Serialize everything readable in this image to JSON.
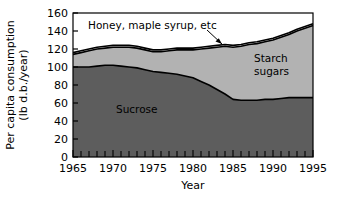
{
  "chart_data": {
    "type": "area",
    "stacked": true,
    "title": "",
    "xlabel": "Year",
    "ylabel": "Per capita consumption (lb d.b./year)",
    "ylabel_line1": "Per capita consumption",
    "ylabel_line2": "(lb d.b./year)",
    "xlim": [
      1965,
      1995
    ],
    "ylim": [
      0,
      160
    ],
    "ytick_labels": [
      "0",
      "20",
      "40",
      "60",
      "80",
      "100",
      "120",
      "140",
      "160"
    ],
    "ytick_values": [
      0,
      20,
      40,
      60,
      80,
      100,
      120,
      140,
      160
    ],
    "xtick_labels": [
      "1965",
      "1970",
      "1975",
      "1980",
      "1985",
      "1990",
      "1995"
    ],
    "xtick_values": [
      1965,
      1970,
      1975,
      1980,
      1985,
      1990,
      1995
    ],
    "x_minor_tick_step": 1,
    "grid": false,
    "legend_position": "inline-labels",
    "x": [
      1965,
      1966,
      1967,
      1968,
      1969,
      1970,
      1971,
      1972,
      1973,
      1974,
      1975,
      1976,
      1977,
      1978,
      1979,
      1980,
      1981,
      1982,
      1983,
      1984,
      1985,
      1986,
      1987,
      1988,
      1989,
      1990,
      1991,
      1992,
      1993,
      1994,
      1995
    ],
    "series": [
      {
        "name": "Sucrose",
        "label": "Sucrose",
        "color": "#5d5d5d",
        "values": [
          100,
          100,
          100,
          101,
          102,
          102,
          101,
          100,
          99,
          97,
          95,
          94,
          93,
          92,
          90,
          88,
          84,
          80,
          75,
          70,
          64,
          63,
          63,
          63,
          64,
          64,
          65,
          66,
          66,
          66,
          66
        ]
      },
      {
        "name": "Starch sugars",
        "label": "Starch sugars",
        "color": "#b2b2b2",
        "values": [
          14,
          16,
          18,
          19,
          19,
          20,
          21,
          22,
          22,
          22,
          22,
          23,
          25,
          27,
          29,
          31,
          36,
          41,
          47,
          53,
          58,
          60,
          62,
          63,
          64,
          66,
          68,
          70,
          74,
          77,
          80
        ]
      },
      {
        "name": "Honey, maple syrup, etc",
        "label": "Honey, maple syrup, etc",
        "color": "#ffffff",
        "values": [
          2,
          2,
          2,
          2,
          2,
          2,
          2,
          2,
          2,
          2,
          2,
          2,
          2,
          2,
          2,
          2,
          2,
          2,
          2,
          2,
          2,
          2,
          2,
          2,
          2,
          2,
          2,
          2,
          2,
          2,
          2
        ]
      }
    ],
    "totals": [
      116,
      118,
      120,
      122,
      123,
      124,
      124,
      124,
      123,
      121,
      119,
      119,
      120,
      121,
      121,
      121,
      122,
      123,
      124,
      125,
      124,
      125,
      127,
      128,
      130,
      132,
      135,
      138,
      142,
      145,
      148
    ],
    "annotations": [
      {
        "name": "honey-maple-syrup-annotation",
        "text": "Honey, maple syrup, etc",
        "points_to_year": 1984,
        "points_to_value": 126
      }
    ]
  }
}
